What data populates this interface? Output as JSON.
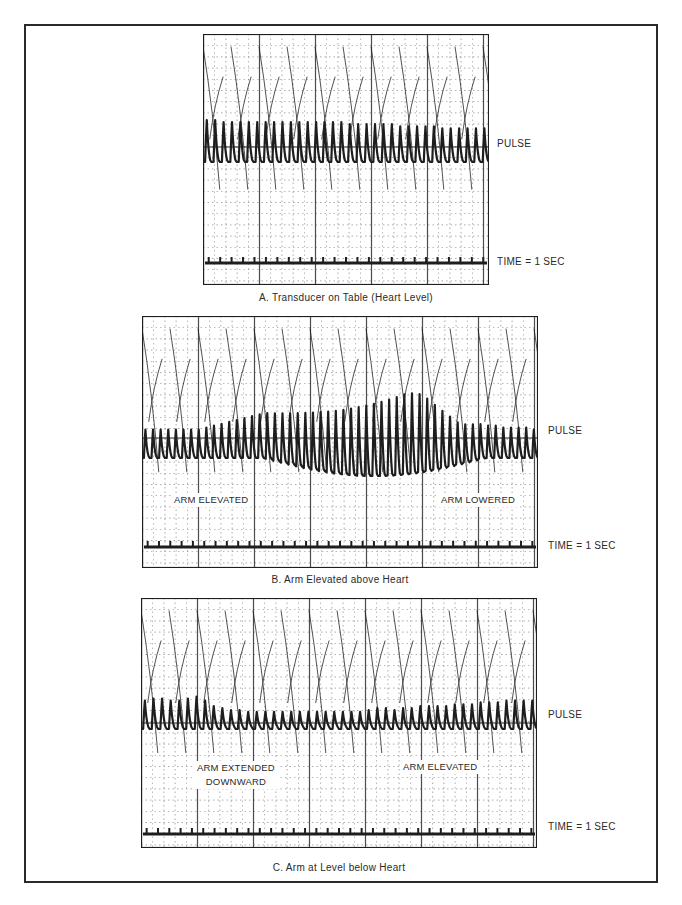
{
  "figure": {
    "panels": [
      {
        "id": "A",
        "caption": "A.  Transducer on Table (Heart Level)",
        "pulse_label": "PULSE",
        "time_label": "TIME  =  1 SEC",
        "annotations": []
      },
      {
        "id": "B",
        "caption": "B.  Arm Elevated above Heart",
        "pulse_label": "PULSE",
        "time_label": "TIME  =  1 SEC",
        "annotations": [
          {
            "lines": [
              "ARM ELEVATED"
            ]
          },
          {
            "lines": [
              "ARM LOWERED"
            ]
          }
        ]
      },
      {
        "id": "C",
        "caption": "C.  Arm at Level below Heart",
        "pulse_label": "PULSE",
        "time_label": "TIME  =  1 SEC",
        "annotations": [
          {
            "lines": [
              "ARM EXTENDED",
              "DOWNWARD"
            ]
          },
          {
            "lines": [
              "ARM ELEVATED"
            ]
          }
        ]
      }
    ],
    "colors": {
      "ink": "#1e1e1e",
      "grid": "#3a3a3a",
      "paper": "#ffffff",
      "frame": "#2a2a2a"
    }
  },
  "chart_data": [
    {
      "type": "line",
      "title": "A. Transducer on Table (Heart Level)",
      "series": [
        {
          "name": "PULSE",
          "description": "Pulse waveform, roughly constant amplitude",
          "beats": 34,
          "relative_amplitude": [
            1.0,
            1.0,
            0.95,
            0.95,
            0.95,
            0.95,
            0.95,
            0.95,
            0.95,
            0.95,
            0.95,
            0.95,
            0.95,
            0.95,
            0.95,
            0.95,
            0.95,
            0.9,
            0.9,
            0.9,
            0.9,
            0.9,
            0.9,
            0.85,
            0.85,
            0.85,
            0.85,
            0.85,
            0.8,
            0.8,
            0.8,
            0.8,
            0.8,
            0.8
          ]
        },
        {
          "name": "TIME = 1 SEC",
          "description": "Time marker ticks, one per second",
          "ticks": 25
        }
      ],
      "xlabel": "",
      "ylabel": "",
      "grid": true
    },
    {
      "type": "line",
      "title": "B. Arm Elevated above Heart",
      "series": [
        {
          "name": "PULSE",
          "description": "Amplitude increases while arm elevated, then decreases when lowered",
          "beats": 52,
          "relative_amplitude": [
            0.75,
            0.75,
            0.75,
            0.75,
            0.75,
            0.75,
            0.75,
            0.75,
            0.8,
            0.85,
            0.9,
            0.95,
            1.0,
            1.05,
            1.1,
            1.15,
            1.2,
            1.25,
            1.3,
            1.35,
            1.4,
            1.45,
            1.5,
            1.55,
            1.6,
            1.65,
            1.7,
            1.75,
            1.8,
            1.85,
            1.9,
            1.95,
            2.0,
            2.05,
            2.1,
            2.1,
            2.05,
            1.9,
            1.7,
            1.5,
            1.3,
            1.1,
            1.0,
            0.95,
            0.9,
            0.85,
            0.85,
            0.8,
            0.8,
            0.8,
            0.8,
            0.75
          ]
        },
        {
          "name": "TIME = 1 SEC",
          "description": "Time marker ticks, one per second",
          "ticks": 35
        }
      ],
      "annotations": [
        "ARM ELEVATED",
        "ARM LOWERED"
      ],
      "xlabel": "",
      "ylabel": "",
      "grid": true
    },
    {
      "type": "line",
      "title": "C. Arm at Level below Heart",
      "series": [
        {
          "name": "PULSE",
          "description": "Amplitude decreases with arm extended downward, recovers when elevated",
          "beats": 46,
          "relative_amplitude": [
            0.75,
            0.8,
            0.8,
            0.75,
            0.75,
            0.8,
            0.85,
            0.75,
            0.6,
            0.55,
            0.5,
            0.5,
            0.45,
            0.45,
            0.45,
            0.45,
            0.45,
            0.45,
            0.45,
            0.45,
            0.45,
            0.45,
            0.45,
            0.45,
            0.45,
            0.45,
            0.5,
            0.55,
            0.55,
            0.5,
            0.55,
            0.55,
            0.6,
            0.6,
            0.6,
            0.6,
            0.65,
            0.65,
            0.65,
            0.7,
            0.7,
            0.7,
            0.75,
            0.75,
            0.75,
            0.75
          ]
        },
        {
          "name": "TIME = 1 SEC",
          "description": "Time marker ticks, one per second",
          "ticks": 35
        }
      ],
      "annotations": [
        "ARM EXTENDED DOWNWARD",
        "ARM ELEVATED"
      ],
      "xlabel": "",
      "ylabel": "",
      "grid": true
    }
  ]
}
